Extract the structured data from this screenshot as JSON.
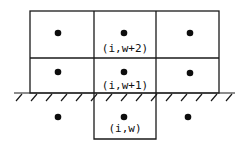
{
  "diagram": {
    "colors": {
      "line": "#1a1a1a",
      "dot": "#0d0d0d",
      "background": "#ffffff"
    },
    "labels": {
      "top_center": "(i,w+2)",
      "middle_center": "(i,w+1)",
      "bottom_center": "(i,w)"
    },
    "boundary": {
      "type": "wall",
      "hatched": true
    },
    "grid": {
      "columns": 3,
      "rows_above_wall": 2,
      "rows_below_wall": 1
    }
  }
}
